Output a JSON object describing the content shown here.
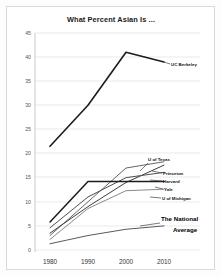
{
  "chart_data": {
    "type": "line",
    "title": "What Percent Asian Is ...",
    "xlabel": "",
    "ylabel": "",
    "x": [
      1980,
      1990,
      2000,
      2010
    ],
    "categories": [
      "1980",
      "1990",
      "2000",
      "2010"
    ],
    "xlim": [
      1976,
      2014
    ],
    "ylim": [
      0,
      45
    ],
    "yticks": [
      0,
      5,
      10,
      15,
      20,
      25,
      30,
      35,
      40,
      45
    ],
    "ytick_labels": [
      "0",
      "5",
      "10",
      "15",
      "20",
      "25",
      "30",
      "35",
      "40",
      "45"
    ],
    "xtick_labels": [
      "1980",
      "1990",
      "2000",
      "2010"
    ],
    "grid": true,
    "legend_position": "right-inline-annotations",
    "series": [
      {
        "name": "UC Berkeley",
        "label": "UC Berkeley",
        "values": [
          21.5,
          30.0,
          41.0,
          39.0
        ],
        "color": "#1c1c1c",
        "width": 1.6
      },
      {
        "name": "U of Texas",
        "label": "U of Texas",
        "values": [
          3.0,
          10.0,
          17.0,
          18.3
        ],
        "color": "#666666",
        "width": 1.0
      },
      {
        "name": "Princeton",
        "label": "Princeton",
        "values": [
          3.5,
          9.0,
          14.0,
          17.6
        ],
        "color": "#3c3c3c",
        "width": 1.0
      },
      {
        "name": "Harvard",
        "label": "Harvard",
        "values": [
          4.6,
          11.0,
          15.0,
          16.1
        ],
        "color": "#4f4f4f",
        "width": 1.0
      },
      {
        "name": "Yale",
        "label": "Yale",
        "values": [
          5.8,
          14.2,
          14.2,
          14.2
        ],
        "color": "#1c1c1c",
        "width": 1.5
      },
      {
        "name": "U of Michigan",
        "label": "U of Michigan",
        "values": [
          2.2,
          8.6,
          12.3,
          12.6
        ],
        "color": "#8a8a8a",
        "width": 1.0
      },
      {
        "name": "The National Average",
        "label": "The National Average",
        "values": [
          1.3,
          3.0,
          4.3,
          5.0
        ],
        "color": "#5a5a5a",
        "width": 1.0
      }
    ],
    "annotations": [
      {
        "text": "UC Berkeley",
        "series": "UC Berkeley"
      },
      {
        "text": "U of Texas",
        "series": "U of Texas"
      },
      {
        "text": "Princeton",
        "series": "Princeton"
      },
      {
        "text": "Harvard",
        "series": "Harvard"
      },
      {
        "text": "Yale",
        "series": "Yale"
      },
      {
        "text": "U of Michigan",
        "series": "U of Michigan"
      },
      {
        "text": "The National",
        "series": "The National Average"
      },
      {
        "text": "Average",
        "series": "The National Average"
      }
    ]
  },
  "labels": {
    "title": "What Percent Asian Is ...",
    "y": {
      "t45": "45",
      "t40": "40",
      "t35": "35",
      "t30": "30",
      "t25": "25",
      "t20": "20",
      "t15": "15",
      "t10": "10",
      "t5": "5",
      "t0": "0"
    },
    "x": {
      "x1980": "1980",
      "x1990": "1990",
      "x2000": "2000",
      "x2010": "2010"
    },
    "series": {
      "berkeley": "UC Berkeley",
      "texas": "U of Texas",
      "princeton": "Princeton",
      "harvard": "Harvard",
      "yale": "Yale",
      "michigan": "U of Michigan",
      "national_line1": "The National",
      "national_line2": "Average"
    }
  }
}
